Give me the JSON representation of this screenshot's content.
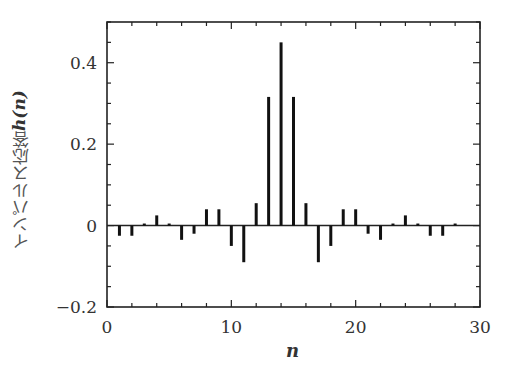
{
  "chart_data": {
    "type": "stem",
    "title": "",
    "xlabel": "n",
    "ylabel": "インパルス応答 h(n)",
    "ylabel_text": "インパルス応答",
    "ylabel_symbol": "h(n)",
    "xlim": [
      0,
      30
    ],
    "ylim": [
      -0.2,
      0.5
    ],
    "xticks": [
      0,
      10,
      20,
      30
    ],
    "xtick_labels": [
      "0",
      "10",
      "20",
      "30"
    ],
    "yticks": [
      -0.2,
      0,
      0.2,
      0.4
    ],
    "ytick_labels": [
      "−0.2",
      "0",
      "0.2",
      "0.4"
    ],
    "x_minor_step": 2,
    "y_minor_step": 0.05,
    "grid": false,
    "legend": null,
    "x": [
      0,
      1,
      2,
      3,
      4,
      5,
      6,
      7,
      8,
      9,
      10,
      11,
      12,
      13,
      14,
      15,
      16,
      17,
      18,
      19,
      20,
      21,
      22,
      23,
      24,
      25,
      26,
      27,
      28
    ],
    "values": [
      0,
      -0.025,
      -0.025,
      0.005,
      0.025,
      0.005,
      -0.035,
      -0.02,
      0.04,
      0.04,
      -0.05,
      -0.09,
      0.055,
      0.316,
      0.45,
      0.316,
      0.055,
      -0.09,
      -0.05,
      0.04,
      0.04,
      -0.02,
      -0.035,
      0.005,
      0.025,
      0.005,
      -0.025,
      -0.025,
      0.005
    ]
  }
}
